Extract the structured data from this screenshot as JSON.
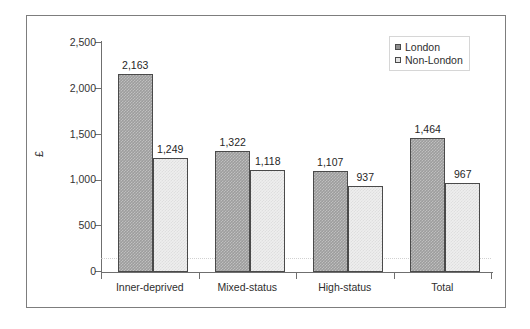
{
  "chart_data": {
    "type": "bar",
    "title": "",
    "subtitle": "",
    "xlabel": "",
    "ylabel": "£",
    "ylim": [
      0,
      2500
    ],
    "ytick_values": [
      0,
      500,
      1000,
      1500,
      2000,
      2500
    ],
    "ytick_labels": [
      "0",
      "500",
      "1,000",
      "1,500",
      "2,000",
      "2,500"
    ],
    "categories": [
      "Inner-deprived",
      "Mixed-status",
      "High-status",
      "Total"
    ],
    "grid": false,
    "legend_position": "top-right",
    "series": [
      {
        "name": "London",
        "color": "#9d9d9d",
        "values": [
          2163,
          1322,
          1107,
          1464
        ],
        "labels": [
          "2,163",
          "1,322",
          "1,107",
          "1,464"
        ]
      },
      {
        "name": "Non-London",
        "color": "#eeeeee",
        "values": [
          1249,
          1118,
          937,
          967
        ],
        "labels": [
          "1,249",
          "1,118",
          "937",
          "967"
        ]
      }
    ]
  },
  "legend": {
    "items": [
      {
        "label": "London",
        "swatch": "london-swatch"
      },
      {
        "label": "Non-London",
        "swatch": "non-london-swatch"
      }
    ]
  },
  "axes": {
    "y_title": "£"
  }
}
